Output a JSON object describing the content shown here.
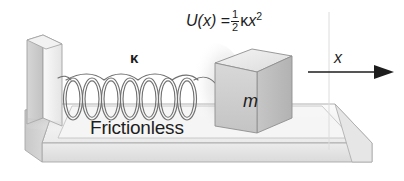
{
  "figure": {
    "background_color": "#ffffff"
  },
  "labels": {
    "equation": {
      "function": "U(x)",
      "equals": "=",
      "fraction_numerator": "1",
      "fraction_denominator": "2",
      "spring_constant_symbol": "κ",
      "variable": "x",
      "exponent": "2",
      "full_text": "U(x) = ½κx²"
    },
    "spring_constant": "κ",
    "surface": "Frictionless",
    "mass": "m",
    "axis": "x"
  },
  "colors": {
    "ink": "#1d1d1d",
    "outline": "#8b8b8b",
    "platform_top": "#f2f2f2",
    "platform_front": "#e2e2e2",
    "platform_side": "#d0d0d0",
    "wall_face": "#ededed",
    "wall_side": "#cfcfcf",
    "block_front": "#cfcfcf",
    "block_top": "#ededed",
    "block_side": "#bdbdbd",
    "spring_wire": "#6f6f6f",
    "shadow": "#bcbcbc"
  },
  "geometry": {
    "spring_coil_count": 7,
    "arrow_direction": "right",
    "view": "3d-perspective"
  }
}
